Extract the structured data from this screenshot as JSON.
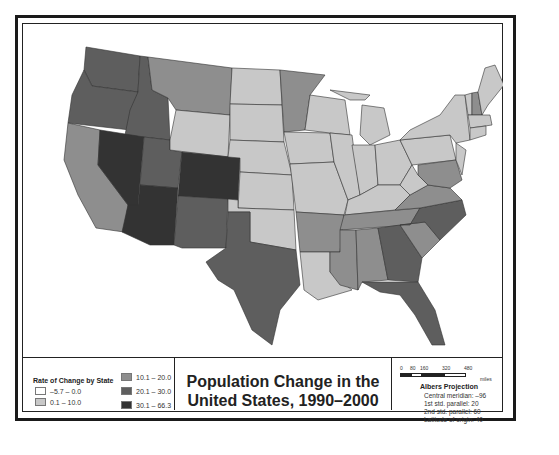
{
  "map": {
    "title_line1": "Population Change in the",
    "title_line2": "United States, 1990–2000",
    "colors": {
      "class1": "#ffffff",
      "class2": "#c8c8c8",
      "class3": "#8e8e8e",
      "class4": "#5e5e5e",
      "class5": "#333333",
      "border": "#222222"
    }
  },
  "legend": {
    "title": "Rate of Change by State",
    "items": [
      {
        "label": "–5.7 – 0.0",
        "color": "#ffffff"
      },
      {
        "label": "0.1 – 10.0",
        "color": "#c8c8c8"
      },
      {
        "label": "10.1 – 20.0",
        "color": "#8e8e8e"
      },
      {
        "label": "20.1 – 30.0",
        "color": "#5e5e5e"
      },
      {
        "label": "30.1 – 66.3",
        "color": "#333333"
      }
    ]
  },
  "scale": {
    "ticks": [
      "0",
      "80",
      "160",
      "320",
      "480"
    ],
    "unit": "miles"
  },
  "projection": {
    "title": "Albers Projection",
    "lines": [
      "Central meridian: –96",
      "1st std. parallel: 20",
      "2nd std. parallel: 60",
      "Latitude of origin: 40"
    ]
  }
}
